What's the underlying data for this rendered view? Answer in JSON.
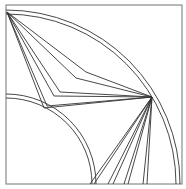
{
  "figure": {
    "stroke_color": "#333333",
    "frame_color": "#8a8a8a",
    "background": "#ffffff",
    "frame": {
      "x": 6,
      "y": 5,
      "w": 176,
      "h": 179
    },
    "center": {
      "x": 6,
      "y": 184
    },
    "outer_arcs": [
      174,
      170
    ],
    "inner_arcs": [
      90,
      86
    ],
    "top_left_point": {
      "x": 7,
      "y": 12
    },
    "focal_point": {
      "x": 152,
      "y": 97
    },
    "upper_fan_elbows": [
      {
        "x": 86,
        "y": 72
      },
      {
        "x": 76,
        "y": 78
      },
      {
        "x": 60,
        "y": 92
      },
      {
        "x": 54,
        "y": 96
      },
      {
        "x": 47,
        "y": 106
      },
      {
        "x": 44,
        "y": 108
      }
    ],
    "lower_fan_ends": [
      {
        "x": 90,
        "y": 184
      },
      {
        "x": 94,
        "y": 184
      },
      {
        "x": 108,
        "y": 184
      },
      {
        "x": 113,
        "y": 184
      },
      {
        "x": 124,
        "y": 184
      },
      {
        "x": 128,
        "y": 184
      },
      {
        "x": 143,
        "y": 184
      },
      {
        "x": 147,
        "y": 184
      }
    ]
  }
}
